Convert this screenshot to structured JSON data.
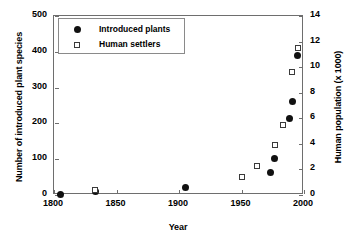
{
  "chart_data": {
    "type": "scatter",
    "title": "",
    "xlabel": "Year",
    "ylabel": "Number of introduced plant species",
    "ylabel_right": "Human population (x 1000)",
    "xlim": [
      1800,
      2000
    ],
    "ylim": [
      0,
      500
    ],
    "ylim_right": [
      0,
      14
    ],
    "xticks": [
      1800,
      1850,
      1900,
      1950,
      2000
    ],
    "yticks": [
      0,
      100,
      200,
      300,
      400,
      500
    ],
    "yticks_right": [
      0,
      2,
      4,
      6,
      8,
      10,
      12,
      14
    ],
    "grid": false,
    "legend_position": "top-left",
    "series": [
      {
        "name": "Introduced plants",
        "marker": "filled-circle",
        "axis": "left",
        "points": [
          {
            "x": 1805,
            "y": 2
          },
          {
            "x": 1833,
            "y": 11
          },
          {
            "x": 1905,
            "y": 22
          },
          {
            "x": 1973,
            "y": 62
          },
          {
            "x": 1976,
            "y": 101
          },
          {
            "x": 1988,
            "y": 215
          },
          {
            "x": 1991,
            "y": 260
          },
          {
            "x": 1995,
            "y": 390
          }
        ]
      },
      {
        "name": "Human settlers",
        "marker": "open-square",
        "axis": "right",
        "points": [
          {
            "x": 1833,
            "y": 0.4,
            "y_left_equiv": 62
          },
          {
            "x": 1950,
            "y": 1.4,
            "y_left_equiv": 94
          },
          {
            "x": 1962,
            "y": 2.3,
            "y_left_equiv": 123
          },
          {
            "x": 1977,
            "y": 3.9,
            "y_left_equiv": 175
          },
          {
            "x": 1983,
            "y": 5.5,
            "y_left_equiv": 233
          },
          {
            "x": 1990,
            "y": 9.6,
            "y_left_equiv": 345
          },
          {
            "x": 1995,
            "y": 11.5,
            "y_left_equiv": 410
          }
        ]
      }
    ]
  },
  "axes": {
    "x_tick_labels": [
      "1800",
      "1850",
      "1900",
      "1950",
      "2000"
    ],
    "y_left_tick_labels": [
      "0",
      "100",
      "200",
      "300",
      "400",
      "500"
    ],
    "y_right_tick_labels": [
      "0",
      "2",
      "4",
      "6",
      "8",
      "10",
      "12",
      "14"
    ],
    "x_title": "Year",
    "y_left_title": "Number of introduced plant species",
    "y_right_title": "Human population (x 1000)"
  },
  "legend": {
    "entries": [
      {
        "label": "Introduced plants",
        "marker": "filled-circle"
      },
      {
        "label": "Human settlers",
        "marker": "open-square"
      }
    ]
  },
  "colors": {
    "marker_fill": "#111111",
    "marker_open_border": "#3a3a3a",
    "axis": "#6e6e6e",
    "text": "#000000",
    "background": "#ffffff"
  }
}
